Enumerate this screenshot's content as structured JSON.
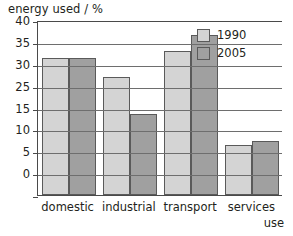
{
  "chart_data": {
    "type": "bar",
    "title": "energy used / %",
    "xlabel": "use",
    "ylabel": "energy used / %",
    "categories": [
      "domestic",
      "industrial",
      "transport",
      "services"
    ],
    "series": [
      {
        "name": "1990",
        "color": "#d4d4d4",
        "values": [
          31.3,
          27.0,
          33.0,
          11.5
        ]
      },
      {
        "name": "2005",
        "color": "#a0a0a0",
        "values": [
          31.3,
          18.5,
          36.6,
          12.3
        ]
      }
    ],
    "ylim": [
      0,
      40
    ],
    "ytick_values": [
      40,
      35,
      30,
      25,
      20,
      15,
      10,
      5,
      0
    ],
    "ytick_labels": [
      "40",
      "35",
      "30",
      "25",
      "15",
      "10",
      "5",
      "0"
    ],
    "grid": true,
    "legend_position": "top-right",
    "bar_border_color": "#5a5a5a",
    "axis_color": "#4a4a4a",
    "grid_color": "#6e6e6e",
    "background": "#ffffff"
  }
}
